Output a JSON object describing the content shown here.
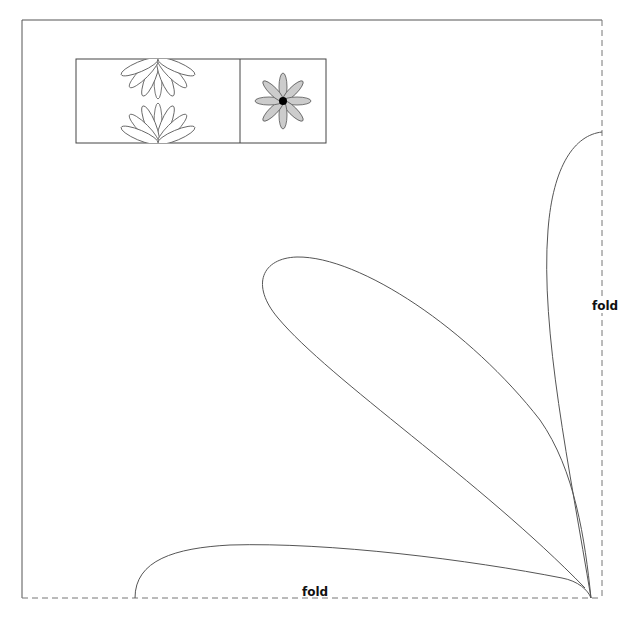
{
  "diagram": {
    "type": "sewing-pattern-template",
    "colors": {
      "outline": "#555555",
      "border": "#444444",
      "fold_line": "#777777",
      "thumbnail_petal_fill": "#cccccc",
      "thumbnail_center": "#000000",
      "background": "#ffffff"
    },
    "labels": {
      "fold_right": "fold",
      "fold_bottom": "fold"
    },
    "thumbnail": {
      "panels": [
        {
          "name": "stacked-half-flowers",
          "description": "two half-flower outlines facing each other"
        },
        {
          "name": "full-flower",
          "description": "eight gray petals around a black center",
          "petal_count": 8
        }
      ]
    },
    "main_template": {
      "petals": [
        {
          "name": "vertical-petal",
          "tip": "top-right near fold"
        },
        {
          "name": "diagonal-petal",
          "tip": "upper-left"
        },
        {
          "name": "horizontal-petal",
          "tip": "bottom-left near fold"
        }
      ]
    }
  }
}
